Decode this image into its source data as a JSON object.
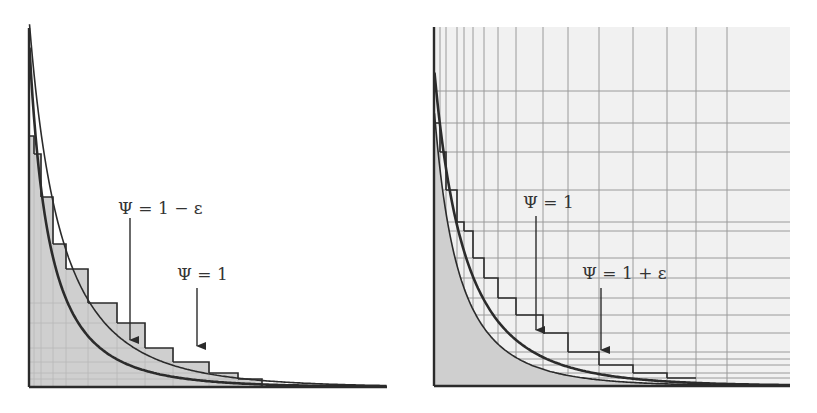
{
  "colors": {
    "background": "#ffffff",
    "paper_tint": "#f1f1f1",
    "fill_shade": "#cfcfcf",
    "ink": "#2b2b2b",
    "grid": "#9a9a9a",
    "faint_grid": "#b8b8b8"
  },
  "left_panel": {
    "label_lower": "Ψ = 1 − ε",
    "label_upper": "Ψ = 1",
    "axes": {
      "x0": 29,
      "y0": 387,
      "x1": 387,
      "ytop": 28
    },
    "steps_x": [
      29,
      34,
      41,
      53,
      66,
      88,
      117,
      145,
      173,
      209,
      238,
      262
    ],
    "steps_y": [
      136,
      154,
      197,
      244,
      269,
      303,
      323,
      348,
      362,
      373,
      379
    ],
    "faint_grid_x": [
      34,
      41,
      53,
      66,
      88,
      117,
      145,
      173,
      209,
      238
    ],
    "faint_grid_y": [
      303,
      323,
      348,
      362,
      373,
      379
    ],
    "arrow_lower": {
      "x": 130,
      "y1": 218,
      "y2": 340
    },
    "arrow_upper": {
      "x": 197,
      "y1": 288,
      "y2": 346
    },
    "label_lower_pos": {
      "x": 118,
      "y": 214
    },
    "label_upper_pos": {
      "x": 177,
      "y": 280
    }
  },
  "right_panel": {
    "label_lower": "Ψ = 1",
    "label_upper": "Ψ = 1 + ε",
    "axes": {
      "x0": 434,
      "y0": 386,
      "x1": 790,
      "ytop": 27
    },
    "grid_x": [
      440,
      446,
      457,
      464,
      473,
      484,
      498,
      516,
      543,
      568,
      599,
      633,
      667,
      696,
      727
    ],
    "grid_y": [
      91,
      123,
      152,
      190,
      222,
      231,
      258,
      278,
      298,
      315,
      333,
      352,
      359,
      365,
      373,
      378
    ],
    "steps_x": [
      434,
      440,
      446,
      457,
      464,
      473,
      484,
      498,
      516,
      543,
      568,
      599,
      633,
      667,
      696
    ],
    "steps_y": [
      123,
      152,
      190,
      222,
      231,
      258,
      278,
      298,
      315,
      333,
      352,
      365,
      373,
      378
    ],
    "arrow_lower": {
      "x": 536,
      "y1": 216,
      "y2": 330
    },
    "arrow_upper": {
      "x": 601,
      "y1": 288,
      "y2": 350
    },
    "label_lower_pos": {
      "x": 523,
      "y": 208
    },
    "label_upper_pos": {
      "x": 582,
      "y": 279
    }
  }
}
